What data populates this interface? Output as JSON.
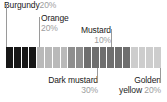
{
  "chart_data": {
    "type": "bar",
    "title": "",
    "xlabel": "",
    "ylabel": "",
    "orientation": "horizontal-stacked",
    "grid": false,
    "legend": "inline-callouts",
    "categories": [
      "Burgundy",
      "Orange",
      "Mustard",
      "Dark mustard",
      "Golden yellow"
    ],
    "values": [
      20,
      20,
      10,
      30,
      20
    ],
    "value_unit": "%",
    "total": 100,
    "segment_count": 20,
    "segment_value": 5,
    "series": [
      {
        "name": "Share",
        "values": [
          20,
          20,
          10,
          30,
          20
        ]
      }
    ],
    "swatches": [
      {
        "name": "Burgundy",
        "percent": "20%",
        "value": 20,
        "color": "#171717",
        "segments": 4
      },
      {
        "name": "Orange",
        "percent": "20%",
        "value": 20,
        "color": "#b9b9b9",
        "segments": 4
      },
      {
        "name": "Mustard",
        "percent": "10%",
        "value": 10,
        "color": "#8e8e8e",
        "segments": 2
      },
      {
        "name": "Dark mustard",
        "percent": "30%",
        "value": 30,
        "color": "#6e6e6e",
        "segments": 6
      },
      {
        "name": "Golden yellow",
        "percent": "20%",
        "value": 20,
        "color": "#cdcdcd",
        "segments": 4
      }
    ],
    "annotations": [
      {
        "id": "burgundy",
        "name": "Burgundy",
        "percent": "20%",
        "position": "above-left"
      },
      {
        "id": "orange",
        "name": "Orange",
        "percent": "20%",
        "position": "above"
      },
      {
        "id": "mustard",
        "name": "Mustard",
        "percent": "10%",
        "position": "above"
      },
      {
        "id": "dark-mustard",
        "name": "Dark mustard",
        "percent": "30%",
        "position": "below"
      },
      {
        "id": "golden-yellow",
        "name": "Golden",
        "name2": "yellow",
        "percent": "20%",
        "position": "below-right"
      }
    ]
  },
  "callouts": {
    "burgundy": {
      "name": "Burgundy",
      "percent": "20%"
    },
    "orange": {
      "name": "Orange",
      "percent": "20%"
    },
    "mustard": {
      "name": "Mustard",
      "percent": "10%"
    },
    "dark_mustard": {
      "name": "Dark mustard",
      "percent": "30%"
    },
    "golden_yellow": {
      "line1": "Golden",
      "line2": "yellow",
      "percent": "20%"
    }
  },
  "colors": {
    "burgundy": "#171717",
    "orange": "#b9b9b9",
    "mustard": "#8e8e8e",
    "dark_mustard": "#6e6e6e",
    "golden_yellow": "#cdcdcd",
    "leader": "#9a9a9a",
    "text": "#1a1a1a",
    "percent_text": "#9d9d9d",
    "background": "#ffffff"
  }
}
